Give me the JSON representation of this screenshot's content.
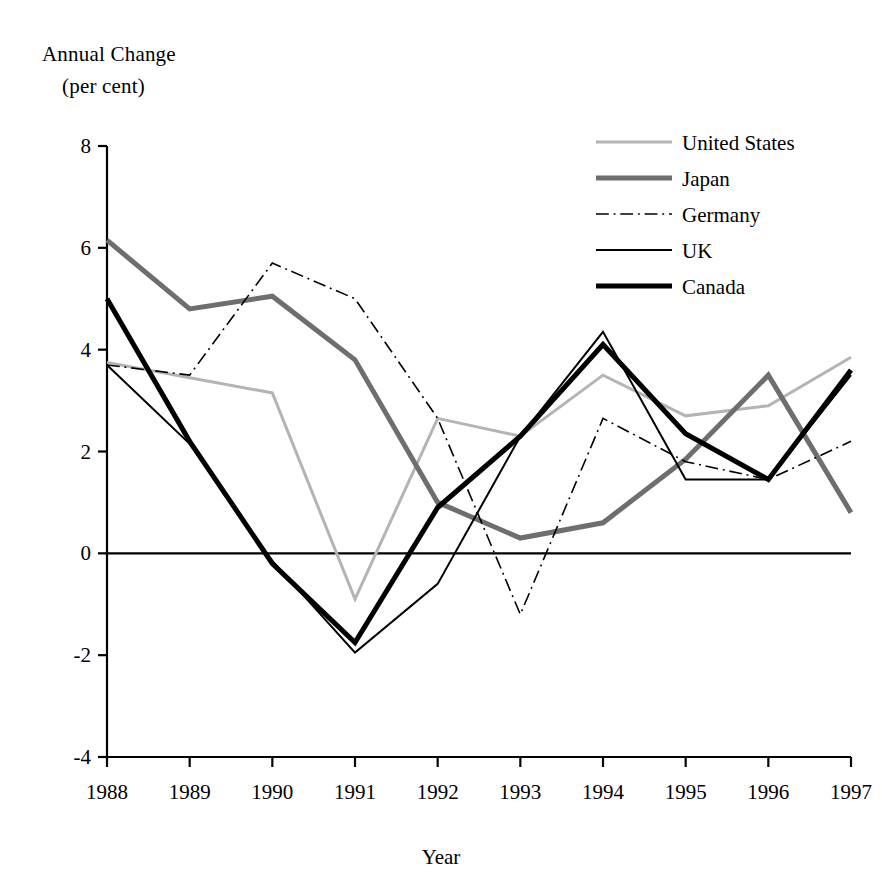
{
  "chart_data": {
    "type": "line",
    "title": "Annual Change",
    "subtitle": "(per cent)",
    "ylabel_line1": "Annual Change",
    "ylabel_line2": "(per cent)",
    "xlabel": "Year",
    "categories": [
      "1988",
      "1989",
      "1990",
      "1991",
      "1992",
      "1993",
      "1994",
      "1995",
      "1996",
      "1997"
    ],
    "x": [
      1988,
      1989,
      1990,
      1991,
      1992,
      1993,
      1994,
      1995,
      1996,
      1997
    ],
    "ylim": [
      -4,
      8
    ],
    "yticks": [
      8,
      6,
      4,
      2,
      0,
      -2,
      -4
    ],
    "ytick_labels": [
      "8",
      "6",
      "4",
      "2",
      "0",
      "-2",
      "-4"
    ],
    "xlim": [
      1988,
      1997
    ],
    "grid": false,
    "zero_line": true,
    "legend_position": "top-right",
    "series": [
      {
        "name": "United States",
        "color": "#b4b4b4",
        "width": 3,
        "dash": "none",
        "values": [
          3.75,
          3.45,
          3.15,
          -0.9,
          2.65,
          2.3,
          3.5,
          2.7,
          2.9,
          3.85
        ]
      },
      {
        "name": "Japan",
        "color": "#6e6e6e",
        "width": 5,
        "dash": "none",
        "values": [
          6.15,
          4.8,
          5.05,
          3.8,
          1.0,
          0.3,
          0.6,
          1.85,
          3.5,
          0.8
        ]
      },
      {
        "name": "Germany",
        "color": "#000000",
        "width": 1.6,
        "dash": "dashdot",
        "values": [
          3.7,
          3.5,
          5.7,
          5.0,
          2.65,
          -1.2,
          2.65,
          1.8,
          1.45,
          2.2
        ]
      },
      {
        "name": "UK",
        "color": "#000000",
        "width": 2,
        "dash": "none",
        "values": [
          3.7,
          2.15,
          -0.15,
          -1.95,
          -0.6,
          2.3,
          4.35,
          1.45,
          1.45,
          3.5
        ]
      },
      {
        "name": "Canada",
        "color": "#000000",
        "width": 5,
        "dash": "none",
        "values": [
          5.0,
          2.2,
          -0.2,
          -1.75,
          0.9,
          2.3,
          4.1,
          2.35,
          1.45,
          3.6
        ]
      }
    ]
  }
}
